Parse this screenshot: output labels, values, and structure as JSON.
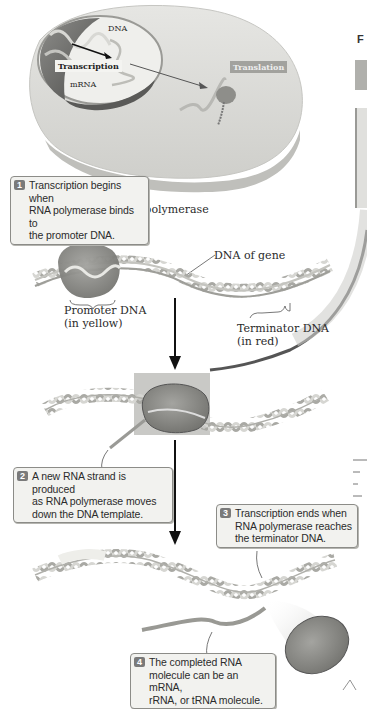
{
  "cell_overview": {
    "dna_label": "DNA",
    "transcription_label": "Transcription",
    "mrna_label": "mRNA",
    "translation_label": "Translation"
  },
  "labels": {
    "rna_polymerase": "RNA polymerase",
    "dna_of_gene": "DNA of gene",
    "promoter_line1": "Promoter DNA",
    "promoter_line2": "(in yellow)",
    "terminator_line1": "Terminator DNA",
    "terminator_line2": "(in red)"
  },
  "steps": [
    {
      "number": "1",
      "line1": "Transcription begins when",
      "line2": "RNA polymerase binds to",
      "line3": "the promoter DNA."
    },
    {
      "number": "2",
      "line1": "A new RNA strand is produced",
      "line2": "as RNA polymerase moves",
      "line3": "down the DNA template."
    },
    {
      "number": "3",
      "line1": "Transcription ends when",
      "line2": "RNA polymerase reaches",
      "line3": "the terminator DNA."
    },
    {
      "number": "4",
      "line1": "The completed RNA",
      "line2": "molecule can be an mRNA,",
      "line3": "rRNA, or tRNA molecule."
    }
  ],
  "right_edge": {
    "clipped_heading": "F"
  },
  "colors": {
    "cell_fill": "#d9d9d6",
    "nucleus_dark": "#6e6e6c",
    "polymerase": "#8a8a86",
    "dna_strand": "#bdbdb8",
    "callout_bg": "#f2f2ef",
    "step_number_bg": "#7a7a7a"
  }
}
